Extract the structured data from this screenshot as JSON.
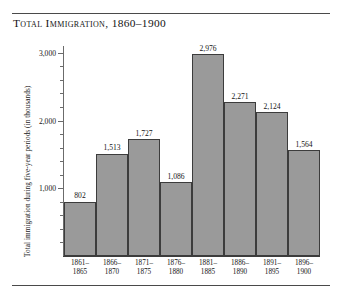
{
  "chart_data": {
    "type": "bar",
    "title": "Total Immigration, 1860–1900",
    "xlabel": "",
    "ylabel": "Total immigration during five-year periods (in thousands)",
    "categories": [
      "1861–1865",
      "1866–1870",
      "1871–1875",
      "1876–1880",
      "1881–1885",
      "1886–1890",
      "1891–1895",
      "1896–1900"
    ],
    "category_lines": [
      [
        "1861–",
        "1865"
      ],
      [
        "1866–",
        "1870"
      ],
      [
        "1871–",
        "1875"
      ],
      [
        "1876–",
        "1880"
      ],
      [
        "1881–",
        "1885"
      ],
      [
        "1886–",
        "1890"
      ],
      [
        "1891–",
        "1895"
      ],
      [
        "1896–",
        "1900"
      ]
    ],
    "values": [
      802,
      1513,
      1727,
      1086,
      2976,
      2271,
      2124,
      1564
    ],
    "value_labels": [
      "802",
      "1,513",
      "1,727",
      "1,086",
      "2,976",
      "2,271",
      "2,124",
      "1,564"
    ],
    "ylim": [
      0,
      3100
    ],
    "y_major_ticks": [
      1000,
      2000,
      3000
    ],
    "y_major_tick_labels": [
      "1,000",
      "2,000",
      "3,000"
    ],
    "y_minor_ticks": [
      200,
      400,
      600,
      800,
      1200,
      1400,
      1600,
      1800,
      2200,
      2400,
      2600,
      2800
    ],
    "grid": false,
    "legend": "none",
    "bar_color": "#9a9a9a",
    "bar_outline_color": "#3c3c3c",
    "axis_color": "#6b6b6b",
    "text_color": "#141414"
  }
}
